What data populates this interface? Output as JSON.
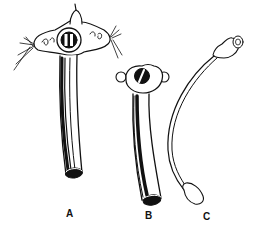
{
  "figure": {
    "parts": [
      {
        "id": "A",
        "label": "A",
        "name": "outer tube with neck flange and ties"
      },
      {
        "id": "B",
        "label": "B",
        "name": "inner cannula"
      },
      {
        "id": "C",
        "label": "C",
        "name": "obturator"
      }
    ],
    "colors": {
      "ink": "#111111",
      "background": "#ffffff"
    }
  }
}
